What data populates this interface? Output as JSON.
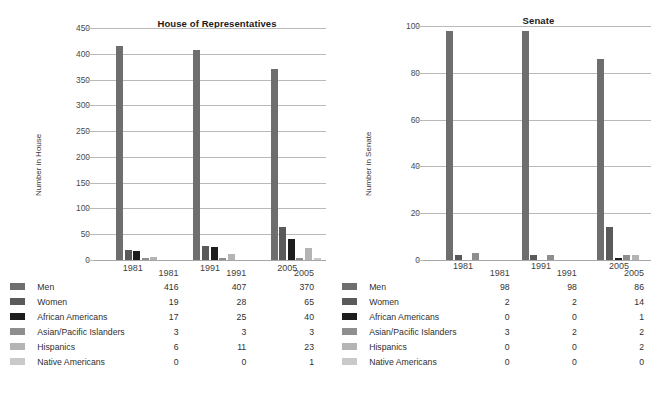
{
  "footnote": "",
  "series_meta": [
    {
      "name": "Men",
      "color": "#6e6e6e"
    },
    {
      "name": "Women",
      "color": "#5a5a5a"
    },
    {
      "name": "African Americans",
      "color": "#1d1d1d"
    },
    {
      "name": "Asian/Pacific Islanders",
      "color": "#8e8e8e"
    },
    {
      "name": "Hispanics",
      "color": "#b4b4b4"
    },
    {
      "name": "Native Americans",
      "color": "#c9c9c9"
    }
  ],
  "panels": [
    {
      "id": "house",
      "title": "House of Representatives",
      "ylabel": "Number in House",
      "table_corner": "",
      "chart_data": {
        "type": "bar",
        "title": "House of Representatives",
        "xlabel": "",
        "ylabel": "Number in House",
        "ylim": [
          0,
          450
        ],
        "ytick_step": 50,
        "yticks": [
          0,
          50,
          100,
          150,
          200,
          250,
          300,
          350,
          400,
          450
        ],
        "grid": true,
        "legend": "below-as-table",
        "categories": [
          "1981",
          "1991",
          "2005"
        ],
        "series": [
          {
            "name": "Men",
            "values": [
              416,
              407,
              370
            ]
          },
          {
            "name": "Women",
            "values": [
              19,
              28,
              65
            ]
          },
          {
            "name": "African Americans",
            "values": [
              17,
              25,
              40
            ]
          },
          {
            "name": "Asian/Pacific Islanders",
            "values": [
              3,
              3,
              3
            ]
          },
          {
            "name": "Hispanics",
            "values": [
              6,
              11,
              23
            ]
          },
          {
            "name": "Native Americans",
            "values": [
              0,
              0,
              1
            ]
          }
        ]
      }
    },
    {
      "id": "senate",
      "title": "Senate",
      "ylabel": "Number in Senate",
      "table_corner": "",
      "chart_data": {
        "type": "bar",
        "title": "Senate",
        "xlabel": "",
        "ylabel": "Number in Senate",
        "ylim": [
          0,
          100
        ],
        "ytick_step": 20,
        "yticks": [
          0,
          20,
          40,
          60,
          80,
          100
        ],
        "grid": true,
        "legend": "below-as-table",
        "categories": [
          "1981",
          "1991",
          "2005"
        ],
        "series": [
          {
            "name": "Men",
            "values": [
              98,
              98,
              86
            ]
          },
          {
            "name": "Women",
            "values": [
              2,
              2,
              14
            ]
          },
          {
            "name": "African Americans",
            "values": [
              0,
              0,
              1
            ]
          },
          {
            "name": "Asian/Pacific Islanders",
            "values": [
              3,
              2,
              2
            ]
          },
          {
            "name": "Hispanics",
            "values": [
              0,
              0,
              2
            ]
          },
          {
            "name": "Native Americans",
            "values": [
              0,
              0,
              0
            ]
          }
        ]
      }
    }
  ]
}
